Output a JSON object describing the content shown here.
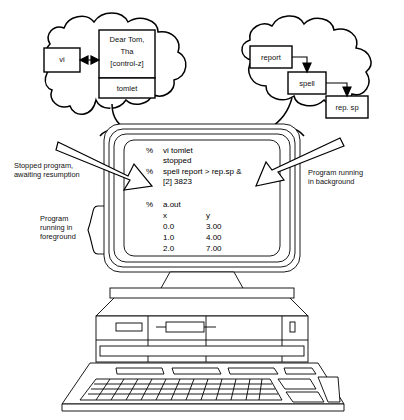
{
  "figure": {
    "line_color": "#000000",
    "fill_color": "#ffffff"
  },
  "left_cloud": {
    "name": "foreground-job-cloud",
    "editor_box": {
      "label": "vi"
    },
    "arrow": {
      "type": "double-headed-arrow"
    },
    "document_box": {
      "body_lines": [
        "Dear Tom,",
        "Tha",
        "[control-z]"
      ],
      "filename": "tomlet"
    }
  },
  "right_cloud": {
    "name": "background-job-cloud",
    "boxes": [
      {
        "label": "report"
      },
      {
        "label": "spell"
      },
      {
        "label": "rep. sp"
      }
    ],
    "arrows": [
      "report-to-spell",
      "spell-to-rep-sp"
    ]
  },
  "annotations": {
    "left": "Stopped program,\nawaiting resumption",
    "right": "Program running\nin background",
    "foreground": "Program\nrunning in\nforeground"
  },
  "screen": {
    "session_lines": [
      {
        "prompt": "%",
        "text": "vi tomlet"
      },
      {
        "prompt": "",
        "text": "stopped"
      },
      {
        "prompt": "%",
        "text": "spell report > rep.sp &"
      },
      {
        "prompt": "",
        "text": "[2] 3823"
      }
    ],
    "program_run": {
      "prompt": "%",
      "text": "a.out"
    },
    "table": {
      "headers": [
        "x",
        "y"
      ],
      "rows": [
        [
          "0.0",
          "3.00"
        ],
        [
          "1.0",
          "4.00"
        ],
        [
          "2.0",
          "7.00"
        ]
      ]
    }
  },
  "hardware": {
    "monitor": "crt-monitor",
    "system_unit": "desktop-case",
    "keyboard": "keyboard",
    "drive_slots": [
      "floppy-slot",
      "tape-slot"
    ],
    "power_led": "power-indicator"
  }
}
